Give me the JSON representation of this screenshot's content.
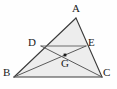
{
  "figure": {
    "type": "geometry-diagram",
    "canvas": {
      "width": 117,
      "height": 89
    },
    "background_color": "#fefefe",
    "stroke_color": "#4a4a4a",
    "outline_color": "#3a3a3a",
    "fill_color": "#ededed",
    "point_color": "#1a1a1a",
    "label_color": "#1a1a1a"
  },
  "points": [
    {
      "id": "A",
      "label": "A",
      "x": 76,
      "y": 18,
      "label_x": 72,
      "label_y": 3,
      "marked": false
    },
    {
      "id": "B",
      "label": "B",
      "x": 14,
      "y": 77,
      "label_x": 3,
      "label_y": 67,
      "marked": false
    },
    {
      "id": "C",
      "label": "C",
      "x": 102,
      "y": 77,
      "label_x": 103,
      "label_y": 67,
      "marked": false
    },
    {
      "id": "D",
      "label": "D",
      "x": 41,
      "y": 46,
      "label_x": 28,
      "label_y": 37,
      "marked": false
    },
    {
      "id": "E",
      "label": "E",
      "x": 86,
      "y": 46,
      "label_x": 88,
      "label_y": 37,
      "marked": false
    },
    {
      "id": "G",
      "label": "G",
      "x": 65,
      "y": 55,
      "label_x": 61,
      "label_y": 58,
      "marked": true
    }
  ],
  "segments": [
    {
      "id": "AB",
      "from": "A",
      "to": "B",
      "name": "side-ab"
    },
    {
      "id": "AC",
      "from": "A",
      "to": "C",
      "name": "side-ac"
    },
    {
      "id": "BC",
      "from": "B",
      "to": "C",
      "name": "side-bc"
    },
    {
      "id": "DE",
      "from": "D",
      "to": "E",
      "name": "midsegment-de"
    },
    {
      "id": "BE",
      "from": "B",
      "to": "E",
      "name": "cevian-be"
    },
    {
      "id": "CD",
      "from": "C",
      "to": "D",
      "name": "cevian-cd"
    }
  ],
  "polygons": [
    {
      "id": "ABC",
      "name": "triangle-abc",
      "points": "76,18 14,77 102,77"
    }
  ]
}
